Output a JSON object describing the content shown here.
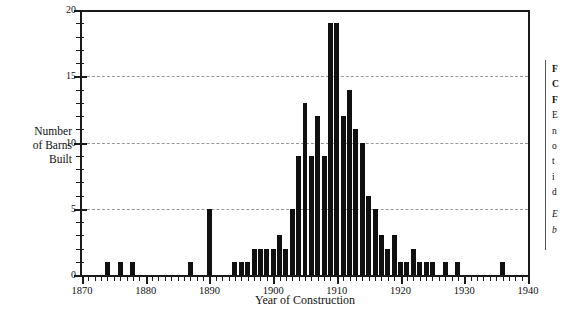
{
  "chart_data": {
    "type": "bar",
    "title": "",
    "xlabel": "Year of Construction",
    "ylabel": "Number of Barns Built",
    "xlim": [
      1870,
      1940
    ],
    "ylim": [
      0,
      20
    ],
    "grid": true,
    "gridlines_y": [
      5,
      10,
      15
    ],
    "legend": "none",
    "x_tick_labels": [
      "1870",
      "1880",
      "1890",
      "1900",
      "1910",
      "1920",
      "1930",
      "1940"
    ],
    "x_tick_values": [
      1870,
      1880,
      1890,
      1900,
      1910,
      1920,
      1930,
      1940
    ],
    "x_minor_tick_step": 1,
    "y_tick_labels": [
      "0",
      "5",
      "10",
      "15",
      "20"
    ],
    "y_tick_values": [
      0,
      5,
      10,
      15,
      20
    ],
    "y_minor_tick_step": 1,
    "bar_color": "#101010",
    "categories": [
      1874,
      1876,
      1878,
      1887,
      1890,
      1894,
      1895,
      1896,
      1897,
      1898,
      1899,
      1900,
      1901,
      1902,
      1903,
      1904,
      1905,
      1906,
      1907,
      1908,
      1909,
      1910,
      1911,
      1912,
      1913,
      1914,
      1915,
      1916,
      1917,
      1918,
      1919,
      1920,
      1921,
      1922,
      1923,
      1924,
      1925,
      1927,
      1929,
      1936
    ],
    "values": [
      1,
      1,
      1,
      1,
      5,
      1,
      1,
      1,
      2,
      2,
      2,
      2,
      3,
      2,
      5,
      9,
      13,
      9,
      12,
      9,
      19,
      19,
      12,
      14,
      11,
      10,
      6,
      5,
      3,
      2,
      3,
      1,
      1,
      2,
      1,
      1,
      1,
      1,
      1,
      1
    ]
  },
  "axes": {
    "y_title_lines": [
      "Number",
      "of Barns",
      "Built"
    ],
    "x_title": "Year of Construction"
  },
  "caption": {
    "title_lines": [
      "F",
      "C",
      "F"
    ],
    "body_lines": [
      "E",
      "n",
      "o",
      "t",
      "i",
      "d"
    ],
    "note_lines": [
      "E",
      "b"
    ]
  }
}
